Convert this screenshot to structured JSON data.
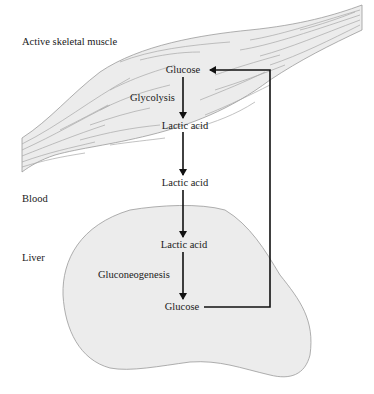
{
  "diagram": {
    "regions": {
      "muscle": "Active skeletal muscle",
      "blood": "Blood",
      "liver": "Liver"
    },
    "processes": {
      "glycolysis": "Glycolysis",
      "gluconeogenesis": "Gluconeogenesis"
    },
    "nodes": {
      "muscle_glucose": "Glucose",
      "muscle_lactic_acid": "Lactic acid",
      "blood_lactic_acid": "Lactic acid",
      "liver_lactic_acid": "Lactic acid",
      "liver_glucose": "Glucose"
    },
    "edges": [
      {
        "from": "muscle_glucose",
        "to": "muscle_lactic_acid",
        "label": "Glycolysis"
      },
      {
        "from": "muscle_lactic_acid",
        "to": "blood_lactic_acid"
      },
      {
        "from": "blood_lactic_acid",
        "to": "liver_lactic_acid"
      },
      {
        "from": "liver_lactic_acid",
        "to": "liver_glucose",
        "label": "Gluconeogenesis"
      },
      {
        "from": "liver_glucose",
        "to": "muscle_glucose"
      }
    ],
    "colors": {
      "organ_fill": "#ececec",
      "organ_stroke": "#9a9a9a",
      "fiber_stroke": "#a8a8a8",
      "arrow": "#111111"
    }
  }
}
